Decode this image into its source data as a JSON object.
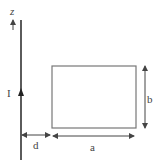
{
  "diagram": {
    "type": "physics-wire-and-loop",
    "labels": {
      "axis": "z",
      "current": "I",
      "distance": "d",
      "width": "a",
      "height": "b"
    },
    "colors": {
      "wire": "#333333",
      "loop": "#777777",
      "arrows": "#444444",
      "text": "#444444"
    }
  }
}
